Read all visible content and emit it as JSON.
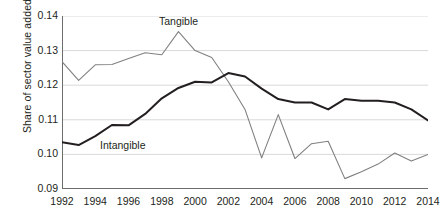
{
  "chart_data": {
    "type": "line",
    "title": "",
    "xlabel": "",
    "ylabel": "Share of sector value added",
    "xlim": [
      1992,
      2014
    ],
    "ylim": [
      0.09,
      0.14
    ],
    "ytick_labels": [
      "0.14",
      "0.13",
      "0.12",
      "0.11",
      "0.10",
      "0.09"
    ],
    "ytick_values": [
      0.14,
      0.13,
      0.12,
      0.11,
      0.1,
      0.09
    ],
    "xtick_labels": [
      "1992",
      "1994",
      "1996",
      "1998",
      "2000",
      "2002",
      "2004",
      "2006",
      "2008",
      "2010",
      "2012",
      "2014"
    ],
    "xtick_values": [
      1992,
      1994,
      1996,
      1998,
      2000,
      2002,
      2004,
      2006,
      2008,
      2010,
      2012,
      2014
    ],
    "grid": "horizontal",
    "legend_position": "inline-annotations",
    "x": [
      1992,
      1993,
      1994,
      1995,
      1996,
      1997,
      1998,
      1999,
      2000,
      2001,
      2002,
      2003,
      2004,
      2005,
      2006,
      2007,
      2008,
      2009,
      2010,
      2011,
      2012,
      2013,
      2014
    ],
    "series": [
      {
        "name": "Tangible",
        "color": "#808080",
        "values": [
          0.1268,
          0.1214,
          0.1259,
          0.126,
          0.1277,
          0.1294,
          0.1288,
          0.1355,
          0.13,
          0.128,
          0.121,
          0.113,
          0.099,
          0.1115,
          0.0988,
          0.1031,
          0.1038,
          0.093,
          0.095,
          0.0972,
          0.1004,
          0.0981,
          0.1
        ]
      },
      {
        "name": "Intangible",
        "color": "#231f20",
        "values": [
          0.1035,
          0.1027,
          0.1053,
          0.1085,
          0.1084,
          0.1117,
          0.1162,
          0.1192,
          0.121,
          0.1208,
          0.1235,
          0.1225,
          0.119,
          0.116,
          0.115,
          0.115,
          0.113,
          0.116,
          0.1155,
          0.1155,
          0.115,
          0.113,
          0.1098
        ]
      }
    ],
    "annotations": [
      {
        "text": "Tangible",
        "x": 1999,
        "y": 0.14
      },
      {
        "text": "Intangible",
        "x": 1996,
        "y": 0.1025
      }
    ]
  },
  "axis": {
    "y_title": "Share of sector value added"
  },
  "style": {
    "grid_color": "#d9d9d9",
    "axis_color": "#6d6d6d",
    "tangible_color": "#808080",
    "intangible_color": "#231f20",
    "background": "#ffffff"
  }
}
